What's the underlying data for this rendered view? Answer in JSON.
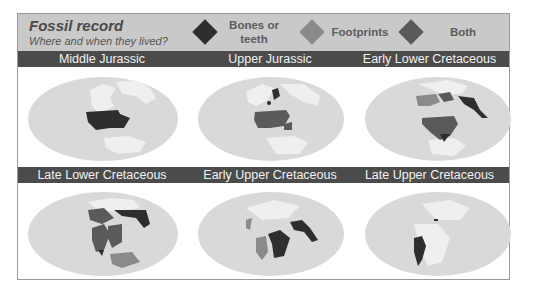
{
  "header": {
    "title": "Fossil record",
    "subtitle": "Where and when they lived?"
  },
  "legend": [
    {
      "label_line1": "Bones or",
      "label_line2": "teeth",
      "color": "#2e2e2e",
      "icon": "diamond-icon"
    },
    {
      "label_line1": "Footprints",
      "label_line2": "",
      "color": "#8a8a8a",
      "icon": "diamond-icon"
    },
    {
      "label_line1": "Both",
      "label_line2": "",
      "color": "#5a5a5a",
      "icon": "diamond-icon"
    }
  ],
  "colors": {
    "frame_border": "#9a9a9a",
    "header_bg": "#c9c9c9",
    "band_bg": "#4b4b4b",
    "ocean": "#d9d9d9",
    "land": "#efefef",
    "bones": "#2e2e2e",
    "footprints": "#8a8a8a",
    "both": "#5a5a5a"
  },
  "periods": [
    {
      "label": "Middle Jurassic",
      "fossil_types": [
        "bones"
      ]
    },
    {
      "label": "Upper Jurassic",
      "fossil_types": [
        "bones",
        "both"
      ]
    },
    {
      "label": "Early Lower Cretaceous",
      "fossil_types": [
        "bones",
        "footprints",
        "both"
      ]
    },
    {
      "label": "Late Lower Cretaceous",
      "fossil_types": [
        "bones",
        "footprints",
        "both"
      ]
    },
    {
      "label": "Early Upper Cretaceous",
      "fossil_types": [
        "bones",
        "footprints"
      ]
    },
    {
      "label": "Late Upper Cretaceous",
      "fossil_types": [
        "bones"
      ]
    }
  ]
}
